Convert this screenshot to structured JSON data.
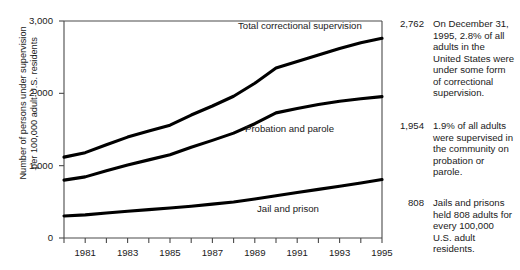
{
  "source_caption": "Justice, 1996a.)",
  "chart_data": {
    "type": "line",
    "title": "",
    "xlabel": "",
    "ylabel_line1": "Number of persons under supervision",
    "ylabel_line2": "per 100,000 adult U.S. residents",
    "grid": false,
    "legend_position": "inline-labels",
    "xlim": [
      1980,
      1995
    ],
    "ylim": [
      0,
      3000
    ],
    "y_ticks": [
      0,
      1000,
      2000,
      3000
    ],
    "y_tick_labels": [
      "0",
      "1,000",
      "2,000",
      "3,000"
    ],
    "x": [
      1980,
      1981,
      1982,
      1983,
      1984,
      1985,
      1986,
      1987,
      1988,
      1989,
      1990,
      1991,
      1992,
      1993,
      1994,
      1995
    ],
    "x_tick_labels": [
      "1981",
      "1983",
      "1985",
      "1987",
      "1989",
      "1991",
      "1993",
      "1995"
    ],
    "x_tick_values": [
      1981,
      1983,
      1985,
      1987,
      1989,
      1991,
      1993,
      1995
    ],
    "series": [
      {
        "name": "Total correctional supervision",
        "label": "Total correctional supervision",
        "end_value": 2762,
        "end_value_label": "2,762",
        "values": [
          1118,
          1180,
          1290,
          1395,
          1478,
          1560,
          1700,
          1825,
          1960,
          2140,
          2350,
          2440,
          2530,
          2620,
          2700,
          2762
        ]
      },
      {
        "name": "Probation and parole",
        "label": "Probation and parole",
        "end_value": 1954,
        "end_value_label": "1,954",
        "values": [
          800,
          845,
          930,
          1010,
          1080,
          1150,
          1255,
          1350,
          1450,
          1580,
          1730,
          1790,
          1845,
          1890,
          1925,
          1954
        ]
      },
      {
        "name": "Jail and prison",
        "label": "Jail and prison",
        "end_value": 808,
        "end_value_label": "808",
        "values": [
          305,
          320,
          345,
          370,
          392,
          415,
          440,
          468,
          498,
          540,
          585,
          628,
          672,
          715,
          760,
          808
        ]
      }
    ],
    "annotations": [
      {
        "value_label": "2,762",
        "text": "On December 31, 1995, 2.8% of all adults in the United States were under some form of correctional supervision."
      },
      {
        "value_label": "1,954",
        "text": "1.9% of all adults were supervised in the community on probation or parole."
      },
      {
        "value_label": "808",
        "text": "Jails and prisons held 808 adults for every 100,000 U.S. adult residents."
      }
    ]
  }
}
